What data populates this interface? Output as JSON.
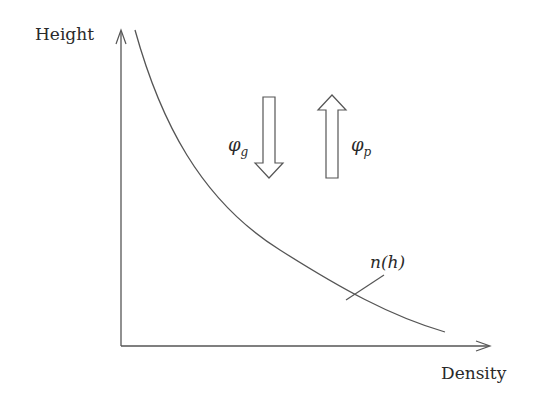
{
  "diagram": {
    "axes": {
      "y_label": "Height",
      "x_label": "Density"
    },
    "curve": {
      "label": "n(h)",
      "description": "decreasing density profile with height"
    },
    "arrows": [
      {
        "direction": "down",
        "label_base": "φ",
        "label_sub": "g"
      },
      {
        "direction": "up",
        "label_base": "φ",
        "label_sub": "p"
      }
    ],
    "colors": {
      "line": "#555555",
      "text": "#2a2a2a",
      "background": "#ffffff"
    }
  }
}
